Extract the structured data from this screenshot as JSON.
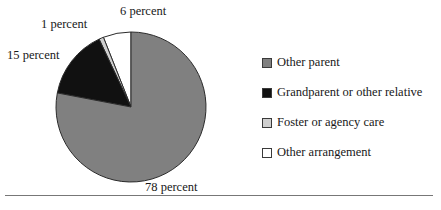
{
  "figure": {
    "title_partial": "",
    "background_color": "#ffffff",
    "rule_color": "#777777"
  },
  "labels": {
    "other_arrangement": "6 percent",
    "foster": "1 percent",
    "grandparent": "15 percent",
    "other_parent": "78 percent"
  },
  "legend": {
    "position": "right",
    "items": [
      {
        "label": "Other parent",
        "color": "#808080",
        "swatch_name": "legend-swatch-other-parent"
      },
      {
        "label": "Grandparent or other relative",
        "color": "#111111",
        "swatch_name": "legend-swatch-grandparent"
      },
      {
        "label": "Foster or agency care",
        "color": "#cfcfcf",
        "swatch_name": "legend-swatch-foster"
      },
      {
        "label": "Other arrangement",
        "color": "#ffffff",
        "swatch_name": "legend-swatch-other-arrangement"
      }
    ]
  },
  "chart_data": {
    "type": "pie",
    "title": "",
    "xlabel": "",
    "ylabel": "",
    "legend_position": "right",
    "grid": false,
    "start_angle_deg": 90,
    "direction": "counterclockwise",
    "center_px": [
      131,
      107
    ],
    "radius_px": 75,
    "categories": [
      "Other parent",
      "Grandparent or other relative",
      "Foster or agency care",
      "Other arrangement"
    ],
    "values": [
      78,
      15,
      1,
      6
    ],
    "value_unit": "percent",
    "data_labels": [
      "78 percent",
      "15 percent",
      "1 percent",
      "6 percent"
    ],
    "colors": [
      "#808080",
      "#111111",
      "#cfcfcf",
      "#ffffff"
    ],
    "slice_border_color": "#2b2b2b",
    "total": 100
  }
}
